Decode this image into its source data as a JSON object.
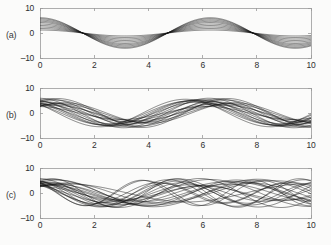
{
  "figure": {
    "background_color": "#fbfbfa",
    "curve_color": "#111111",
    "axis_color": "#9a9a9a",
    "tick_label_color": "#2e2e2e"
  },
  "panels": [
    {
      "id": "a",
      "label": "(a)",
      "xticks": [
        "0",
        "2",
        "4",
        "6",
        "8",
        "10"
      ],
      "yticks": [
        "10",
        "0",
        "-10"
      ]
    },
    {
      "id": "b",
      "label": "(b)",
      "xticks": [
        "0",
        "2",
        "4",
        "6",
        "8",
        "10"
      ],
      "yticks": [
        "10",
        "0",
        "-10"
      ]
    },
    {
      "id": "c",
      "label": "(c)",
      "xticks": [
        "0",
        "2",
        "4",
        "6",
        "8",
        "10"
      ],
      "yticks": [
        "10",
        "0",
        "-10"
      ]
    }
  ],
  "chart_data": [
    {
      "type": "line",
      "panel": "a",
      "title": "",
      "xlabel": "",
      "ylabel": "",
      "xlim": [
        0,
        10
      ],
      "ylim": [
        -10,
        10
      ],
      "xticks": [
        0,
        2,
        4,
        6,
        8,
        10
      ],
      "yticks": [
        -10,
        0,
        10
      ],
      "grid": false,
      "legend": "none",
      "description": "Ensemble of sinusoids sharing one frequency and phase; only amplitude varies.",
      "curve_model": "y = A * cos(w * x + p)",
      "shared_frequency": 1.0,
      "shared_phase": 0.0,
      "series": [
        {
          "name": "curve-1",
          "amplitude": 1.2,
          "frequency": 1.0,
          "phase": 0.0
        },
        {
          "name": "curve-2",
          "amplitude": 1.8,
          "frequency": 1.0,
          "phase": 0.0
        },
        {
          "name": "curve-3",
          "amplitude": 2.4,
          "frequency": 1.0,
          "phase": 0.0
        },
        {
          "name": "curve-4",
          "amplitude": 3.0,
          "frequency": 1.0,
          "phase": 0.0
        },
        {
          "name": "curve-5",
          "amplitude": 3.6,
          "frequency": 1.0,
          "phase": 0.0
        },
        {
          "name": "curve-6",
          "amplitude": 4.2,
          "frequency": 1.0,
          "phase": 0.0
        },
        {
          "name": "curve-7",
          "amplitude": 4.7,
          "frequency": 1.0,
          "phase": 0.0
        },
        {
          "name": "curve-8",
          "amplitude": 5.2,
          "frequency": 1.0,
          "phase": 0.0
        },
        {
          "name": "curve-9",
          "amplitude": 5.7,
          "frequency": 1.0,
          "phase": 0.0
        },
        {
          "name": "curve-10",
          "amplitude": 6.1,
          "frequency": 1.0,
          "phase": 0.0
        }
      ]
    },
    {
      "type": "line",
      "panel": "b",
      "title": "",
      "xlabel": "",
      "ylabel": "",
      "xlim": [
        0,
        10
      ],
      "ylim": [
        -10,
        10
      ],
      "xticks": [
        0,
        2,
        4,
        6,
        8,
        10
      ],
      "yticks": [
        -10,
        0,
        10
      ],
      "grid": false,
      "legend": "none",
      "description": "Ensemble of sinusoids with varying amplitude and phase at a common frequency; curves cross and form narrow waists.",
      "curve_model": "y = A * cos(w * x + p)",
      "shared_frequency": 1.0,
      "series": [
        {
          "name": "curve-1",
          "amplitude": 5.6,
          "frequency": 1.0,
          "phase": -0.3
        },
        {
          "name": "curve-2",
          "amplitude": 4.9,
          "frequency": 1.0,
          "phase": 0.22
        },
        {
          "name": "curve-3",
          "amplitude": 5.2,
          "frequency": 1.0,
          "phase": -0.55
        },
        {
          "name": "curve-4",
          "amplitude": 4.3,
          "frequency": 1.0,
          "phase": 0.48
        },
        {
          "name": "curve-5",
          "amplitude": 5.9,
          "frequency": 1.0,
          "phase": 0.05
        },
        {
          "name": "curve-6",
          "amplitude": 3.7,
          "frequency": 1.0,
          "phase": -0.72
        },
        {
          "name": "curve-7",
          "amplitude": 5.0,
          "frequency": 1.0,
          "phase": 0.66
        },
        {
          "name": "curve-8",
          "amplitude": 4.5,
          "frequency": 1.0,
          "phase": -0.14
        },
        {
          "name": "curve-9",
          "amplitude": 5.4,
          "frequency": 1.0,
          "phase": 0.35
        },
        {
          "name": "curve-10",
          "amplitude": 3.2,
          "frequency": 1.0,
          "phase": -0.45
        },
        {
          "name": "curve-11",
          "amplitude": 4.7,
          "frequency": 1.0,
          "phase": 0.8
        },
        {
          "name": "curve-12",
          "amplitude": 5.8,
          "frequency": 1.0,
          "phase": -0.62
        },
        {
          "name": "curve-13",
          "amplitude": 2.6,
          "frequency": 1.0,
          "phase": 0.12
        },
        {
          "name": "curve-14",
          "amplitude": 4.1,
          "frequency": 1.0,
          "phase": -0.88
        },
        {
          "name": "curve-15",
          "amplitude": 5.1,
          "frequency": 1.0,
          "phase": 0.55
        },
        {
          "name": "curve-16",
          "amplitude": 3.4,
          "frequency": 1.0,
          "phase": -0.05
        },
        {
          "name": "curve-17",
          "amplitude": 5.5,
          "frequency": 1.0,
          "phase": 0.92
        },
        {
          "name": "curve-18",
          "amplitude": 4.0,
          "frequency": 1.0,
          "phase": -0.38
        }
      ]
    },
    {
      "type": "line",
      "panel": "c",
      "title": "",
      "xlabel": "",
      "ylabel": "",
      "xlim": [
        0,
        10
      ],
      "ylim": [
        -10,
        10
      ],
      "xticks": [
        0,
        2,
        4,
        6,
        8,
        10
      ],
      "yticks": [
        -10,
        0,
        10
      ],
      "grid": false,
      "legend": "none",
      "description": "Ensemble of sinusoids with varying amplitude, phase and frequency producing a dense woven lattice with no common nodes.",
      "curve_model": "y = A * cos(w * x + p)",
      "series": [
        {
          "name": "curve-1",
          "amplitude": 5.5,
          "frequency": 0.82,
          "phase": -0.3
        },
        {
          "name": "curve-2",
          "amplitude": 4.8,
          "frequency": 1.18,
          "phase": 0.25
        },
        {
          "name": "curve-3",
          "amplitude": 5.2,
          "frequency": 0.95,
          "phase": -0.6
        },
        {
          "name": "curve-4",
          "amplitude": 4.2,
          "frequency": 1.32,
          "phase": 0.5
        },
        {
          "name": "curve-5",
          "amplitude": 5.8,
          "frequency": 1.05,
          "phase": 0.08
        },
        {
          "name": "curve-6",
          "amplitude": 3.6,
          "frequency": 0.72,
          "phase": -0.75
        },
        {
          "name": "curve-7",
          "amplitude": 5.0,
          "frequency": 1.45,
          "phase": 0.68
        },
        {
          "name": "curve-8",
          "amplitude": 4.4,
          "frequency": 0.88,
          "phase": -0.18
        },
        {
          "name": "curve-9",
          "amplitude": 5.3,
          "frequency": 1.25,
          "phase": 0.38
        },
        {
          "name": "curve-10",
          "amplitude": 3.1,
          "frequency": 1.12,
          "phase": -0.48
        },
        {
          "name": "curve-11",
          "amplitude": 4.6,
          "frequency": 0.78,
          "phase": 0.82
        },
        {
          "name": "curve-12",
          "amplitude": 5.7,
          "frequency": 1.38,
          "phase": -0.65
        },
        {
          "name": "curve-13",
          "amplitude": 2.8,
          "frequency": 1.02,
          "phase": 0.15
        },
        {
          "name": "curve-14",
          "amplitude": 4.0,
          "frequency": 0.92,
          "phase": -0.9
        },
        {
          "name": "curve-15",
          "amplitude": 5.1,
          "frequency": 1.52,
          "phase": 0.58
        },
        {
          "name": "curve-16",
          "amplitude": 3.3,
          "frequency": 1.15,
          "phase": -0.08
        },
        {
          "name": "curve-17",
          "amplitude": 5.4,
          "frequency": 0.85,
          "phase": 0.95
        },
        {
          "name": "curve-18",
          "amplitude": 4.1,
          "frequency": 1.28,
          "phase": -0.4
        },
        {
          "name": "curve-19",
          "amplitude": 4.9,
          "frequency": 0.68,
          "phase": 0.42
        },
        {
          "name": "curve-20",
          "amplitude": 3.8,
          "frequency": 1.42,
          "phase": -0.22
        },
        {
          "name": "curve-21",
          "amplitude": 5.6,
          "frequency": 1.08,
          "phase": 0.72
        },
        {
          "name": "curve-22",
          "amplitude": 3.5,
          "frequency": 0.98,
          "phase": -0.55
        }
      ]
    }
  ]
}
